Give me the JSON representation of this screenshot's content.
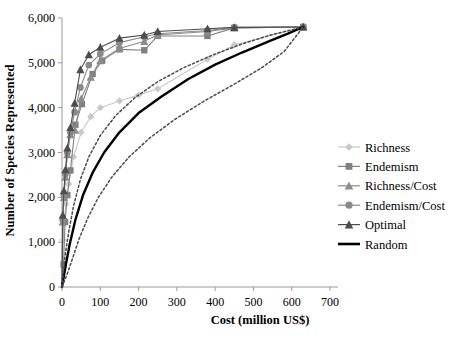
{
  "chart_data": {
    "type": "line",
    "title": "",
    "xlabel": "Cost (million US$)",
    "ylabel": "Number of Species Represented",
    "xlim": [
      0,
      700
    ],
    "ylim": [
      0,
      6000
    ],
    "xticks": [
      0,
      100,
      200,
      300,
      400,
      500,
      600,
      700
    ],
    "xtick_labels": [
      "0",
      "100",
      "200",
      "300",
      "400",
      "500",
      "600",
      "700"
    ],
    "yticks": [
      0,
      1000,
      2000,
      3000,
      4000,
      5000,
      6000
    ],
    "ytick_labels": [
      "0",
      "1,000",
      "2,000",
      "3,000",
      "4,000",
      "5,000",
      "6,000"
    ],
    "grid": false,
    "legend_position": "right",
    "series": [
      {
        "name": "Richness",
        "marker": "diamond",
        "color": "#c9c9c9",
        "line_style": "solid",
        "points": [
          [
            0,
            0
          ],
          [
            3,
            1050
          ],
          [
            6,
            1500
          ],
          [
            10,
            1850
          ],
          [
            18,
            2300
          ],
          [
            30,
            2900
          ],
          [
            50,
            3450
          ],
          [
            75,
            3800
          ],
          [
            100,
            4000
          ],
          [
            150,
            4150
          ],
          [
            200,
            4280
          ],
          [
            250,
            4420
          ],
          [
            380,
            5080
          ],
          [
            450,
            5400
          ],
          [
            630,
            5800
          ]
        ]
      },
      {
        "name": "Endemism",
        "marker": "square",
        "color": "#808080",
        "line_style": "solid",
        "points": [
          [
            0,
            0
          ],
          [
            4,
            500
          ],
          [
            8,
            1450
          ],
          [
            14,
            2050
          ],
          [
            22,
            2600
          ],
          [
            35,
            3620
          ],
          [
            52,
            4080
          ],
          [
            80,
            4750
          ],
          [
            105,
            5050
          ],
          [
            150,
            5300
          ],
          [
            215,
            5280
          ],
          [
            250,
            5600
          ],
          [
            380,
            5600
          ],
          [
            450,
            5780
          ],
          [
            630,
            5800
          ]
        ]
      },
      {
        "name": "Richness/Cost",
        "marker": "triangle",
        "color": "#8c8c8c",
        "line_style": "solid",
        "points": [
          [
            0,
            0
          ],
          [
            2,
            1450
          ],
          [
            5,
            2000
          ],
          [
            9,
            2450
          ],
          [
            14,
            2950
          ],
          [
            22,
            3400
          ],
          [
            34,
            3500
          ],
          [
            50,
            4200
          ],
          [
            75,
            4680
          ],
          [
            100,
            5050
          ],
          [
            150,
            5320
          ],
          [
            215,
            5480
          ],
          [
            250,
            5620
          ],
          [
            380,
            5700
          ],
          [
            450,
            5780
          ],
          [
            630,
            5800
          ]
        ]
      },
      {
        "name": "Endemism/Cost",
        "marker": "circle",
        "color": "#8a8a8a",
        "line_style": "solid",
        "points": [
          [
            0,
            0
          ],
          [
            2,
            1500
          ],
          [
            5,
            2050
          ],
          [
            9,
            2520
          ],
          [
            14,
            3000
          ],
          [
            22,
            3450
          ],
          [
            33,
            3900
          ],
          [
            48,
            4450
          ],
          [
            70,
            4950
          ],
          [
            100,
            5200
          ],
          [
            150,
            5450
          ],
          [
            215,
            5580
          ],
          [
            250,
            5650
          ],
          [
            380,
            5720
          ],
          [
            450,
            5790
          ],
          [
            630,
            5800
          ]
        ]
      },
      {
        "name": "Optimal",
        "marker": "triangle",
        "color": "#4d4d4d",
        "line_style": "solid",
        "points": [
          [
            0,
            0
          ],
          [
            2,
            1600
          ],
          [
            5,
            2150
          ],
          [
            9,
            2620
          ],
          [
            14,
            3100
          ],
          [
            22,
            3560
          ],
          [
            33,
            4100
          ],
          [
            48,
            4850
          ],
          [
            70,
            5180
          ],
          [
            100,
            5350
          ],
          [
            150,
            5550
          ],
          [
            215,
            5620
          ],
          [
            250,
            5700
          ],
          [
            380,
            5760
          ],
          [
            450,
            5790
          ],
          [
            630,
            5800
          ]
        ]
      },
      {
        "name": "Random",
        "marker": "none",
        "color": "#000000",
        "line_style": "solid",
        "points": [
          [
            0,
            0
          ],
          [
            10,
            500
          ],
          [
            20,
            950
          ],
          [
            35,
            1500
          ],
          [
            55,
            2050
          ],
          [
            80,
            2550
          ],
          [
            110,
            3000
          ],
          [
            150,
            3450
          ],
          [
            200,
            3880
          ],
          [
            260,
            4250
          ],
          [
            330,
            4640
          ],
          [
            400,
            4960
          ],
          [
            470,
            5230
          ],
          [
            540,
            5480
          ],
          [
            590,
            5650
          ],
          [
            630,
            5800
          ]
        ]
      },
      {
        "name": "Random upper confidence",
        "marker": "none",
        "color": "#4a4a4a",
        "line_style": "dotted",
        "points": [
          [
            0,
            0
          ],
          [
            8,
            700
          ],
          [
            18,
            1250
          ],
          [
            30,
            1800
          ],
          [
            48,
            2400
          ],
          [
            70,
            2900
          ],
          [
            100,
            3380
          ],
          [
            140,
            3820
          ],
          [
            190,
            4220
          ],
          [
            250,
            4580
          ],
          [
            320,
            4900
          ],
          [
            395,
            5180
          ],
          [
            470,
            5420
          ],
          [
            545,
            5620
          ],
          [
            630,
            5800
          ]
        ]
      },
      {
        "name": "Random lower confidence",
        "marker": "none",
        "color": "#4a4a4a",
        "line_style": "dotted",
        "points": [
          [
            0,
            0
          ],
          [
            14,
            300
          ],
          [
            28,
            650
          ],
          [
            45,
            1080
          ],
          [
            68,
            1550
          ],
          [
            95,
            2000
          ],
          [
            130,
            2450
          ],
          [
            175,
            2900
          ],
          [
            230,
            3330
          ],
          [
            295,
            3740
          ],
          [
            370,
            4140
          ],
          [
            445,
            4500
          ],
          [
            520,
            4880
          ],
          [
            580,
            5250
          ],
          [
            630,
            5800
          ]
        ]
      }
    ]
  },
  "legend": {
    "items": [
      {
        "label": "Richness"
      },
      {
        "label": "Endemism"
      },
      {
        "label": "Richness/Cost"
      },
      {
        "label": "Endemism/Cost"
      },
      {
        "label": "Optimal"
      },
      {
        "label": "Random"
      }
    ]
  }
}
